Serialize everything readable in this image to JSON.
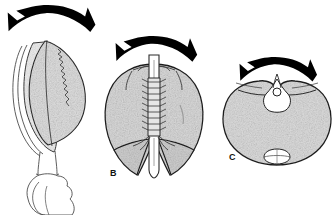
{
  "figure": {
    "background_color": "#ffffff",
    "width": 333,
    "height": 215,
    "panel_count": 3
  },
  "colors": {
    "background": "#ffffff",
    "arrow_fill": "#000000",
    "outline": "#262626",
    "outline_light": "#555555",
    "stipple_fill_light": "#ececec",
    "stipple_fill_mid": "#dcdcdc",
    "stipple_fill_dark": "#cfcfcf",
    "tube_fill": "#ffffff",
    "label_color": "#111111"
  },
  "panels": [
    {
      "id": "panel-a",
      "label": "",
      "label_visible": false,
      "description": "Lateral oblique view of organ with layered longitudinal lobes and a tapering stalk leading to an irregular lobed base",
      "arrow": {
        "name": "bidirectional-curved-arrow",
        "heads": 2,
        "direction": "outward-both-sides",
        "center_x": 48,
        "center_y": 20
      },
      "center_x": 48,
      "center_y": 100
    },
    {
      "id": "panel-b",
      "label": "B",
      "label_visible": true,
      "label_x": 110,
      "label_y": 173,
      "description": "Posterior view showing two symmetric lobes flanking a central vertical ribbed tube with serrated cartilage rings and two inferior curved lobes",
      "arrow": {
        "name": "bidirectional-curved-arrow",
        "heads": 2,
        "direction": "outward-both-sides",
        "center_x": 154,
        "center_y": 50
      },
      "center_x": 154,
      "center_y": 115
    },
    {
      "id": "panel-c",
      "label": "C",
      "label_visible": true,
      "label_x": 233,
      "label_y": 157,
      "description": "Superior transverse view, heart-shaped bilobed outline with a small central apical notch structure and a small oval body at the inferior midline",
      "arrow": {
        "name": "bidirectional-curved-arrow",
        "heads": 2,
        "direction": "outward-both-sides",
        "center_x": 277,
        "center_y": 71
      },
      "center_x": 277,
      "center_y": 118
    }
  ]
}
